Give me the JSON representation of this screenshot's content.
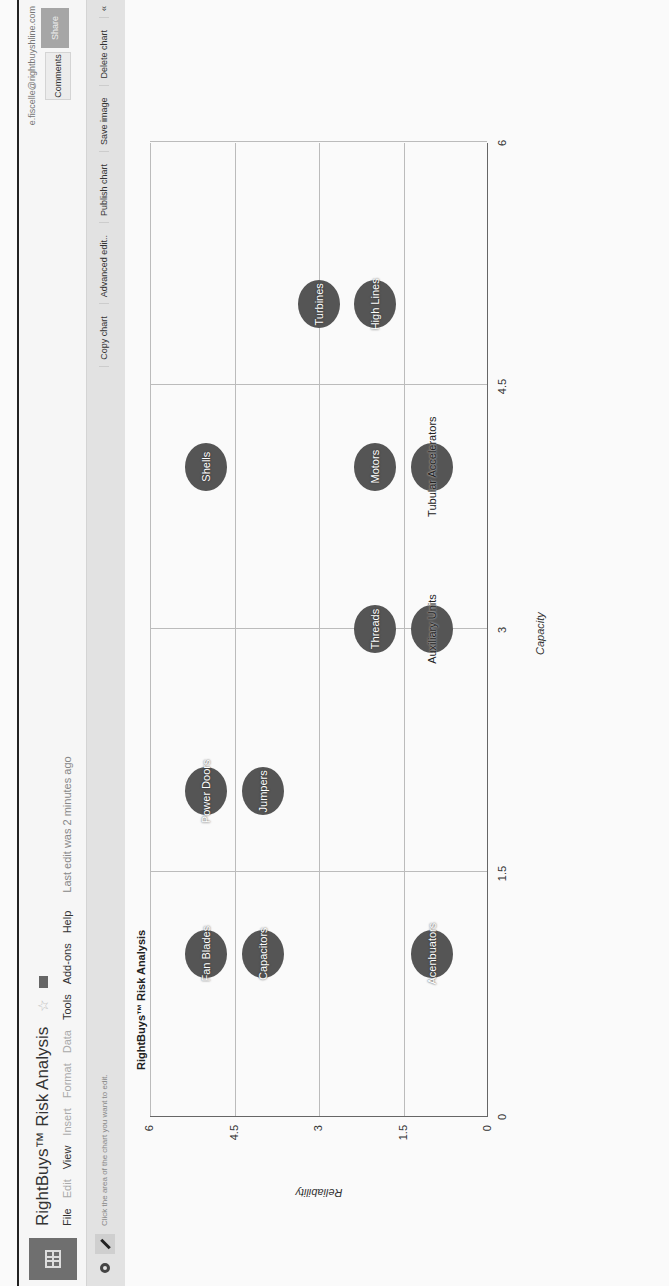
{
  "header": {
    "title": "RightBuys™ Risk Analysis",
    "user_email": "e.fiscelle@rightbuyshline.com",
    "menu": [
      {
        "label": "File",
        "enabled": true
      },
      {
        "label": "Edit",
        "enabled": false
      },
      {
        "label": "View",
        "enabled": true
      },
      {
        "label": "Insert",
        "enabled": false
      },
      {
        "label": "Format",
        "enabled": false
      },
      {
        "label": "Data",
        "enabled": false
      },
      {
        "label": "Tools",
        "enabled": true
      },
      {
        "label": "Add-ons",
        "enabled": true
      },
      {
        "label": "Help",
        "enabled": true
      }
    ],
    "last_edit": "Last edit was 2 minutes ago",
    "comments_label": "Comments",
    "share_label": "Share"
  },
  "toolbar": {
    "hint": "Click the area of the chart you want to edit.",
    "actions": [
      "Copy chart",
      "Advanced edit..",
      "Publish chart",
      "Save image",
      "Delete chart"
    ],
    "collapse_icon": "«"
  },
  "chart_data": {
    "type": "scatter",
    "title": "RightBuys™ Risk Analysis",
    "xlabel": "Capacity",
    "ylabel": "Reliability",
    "xlim": [
      0,
      6
    ],
    "ylim": [
      0,
      6
    ],
    "xticks": [
      "0",
      "1.5",
      "3",
      "4.5",
      "6"
    ],
    "yticks": [
      "0",
      "1.5",
      "3",
      "4.5",
      "6"
    ],
    "grid": true,
    "legend": "none",
    "bubble_color": "#555555",
    "points": [
      {
        "label": "Fan Blades",
        "x": 1,
        "y": 5
      },
      {
        "label": "Capacitors",
        "x": 1,
        "y": 4
      },
      {
        "label": "Acenbuators",
        "x": 1,
        "y": 1
      },
      {
        "label": "Power Doors",
        "x": 2,
        "y": 5
      },
      {
        "label": "Jumpers",
        "x": 2,
        "y": 4
      },
      {
        "label": "Threads",
        "x": 3,
        "y": 2
      },
      {
        "label": "Auxiliary Units",
        "x": 3,
        "y": 1
      },
      {
        "label": "Shells",
        "x": 4,
        "y": 5
      },
      {
        "label": "Motors",
        "x": 4,
        "y": 2
      },
      {
        "label": "Tubular Accelerators",
        "x": 4,
        "y": 1
      },
      {
        "label": "Turbines",
        "x": 5,
        "y": 3
      },
      {
        "label": "High Lines",
        "x": 5,
        "y": 2
      }
    ]
  }
}
